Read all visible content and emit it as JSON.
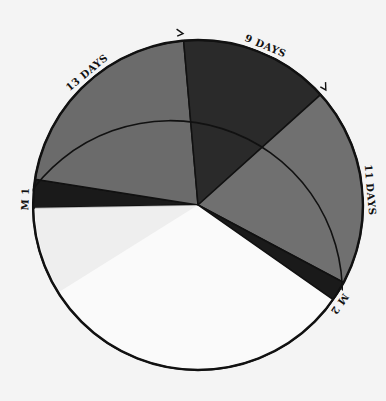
{
  "chart_data": {
    "type": "pie",
    "title": "",
    "note": "Circular cycle diagram divided into phases; white remainder unlabeled",
    "segments": [
      {
        "label": "M 1",
        "start_deg": 171,
        "end_deg": 181,
        "color": "#1a1a1a"
      },
      {
        "label": "13 DAYS",
        "start_deg": 95,
        "end_deg": 171,
        "color": "#6b6b6b"
      },
      {
        "label": "9 DAYS",
        "start_deg": 42,
        "end_deg": 95,
        "color": "#2a2a2a"
      },
      {
        "label": "11 DAYS",
        "start_deg": -28,
        "end_deg": 42,
        "color": "#707070"
      },
      {
        "label": "M 2",
        "start_deg": -35,
        "end_deg": -28,
        "color": "#1a1a1a"
      },
      {
        "label": "",
        "start_deg": -179,
        "end_deg": -35,
        "color": "#fafafa"
      }
    ],
    "arc_labels": [
      {
        "text": "M 1",
        "angle_deg": 178
      },
      {
        "text": "13 DAYS",
        "angle_deg": 130
      },
      {
        "text": "9 DAYS",
        "angle_deg": 67
      },
      {
        "text": "11 DAYS",
        "angle_deg": 5
      },
      {
        "text": "M 2",
        "angle_deg": -35
      }
    ],
    "arrow_marks_deg": [
      95,
      42,
      -33
    ]
  },
  "colors": {
    "background": "#f4f4f4",
    "outline": "#111111",
    "light_wedge": "#ebebeb"
  }
}
